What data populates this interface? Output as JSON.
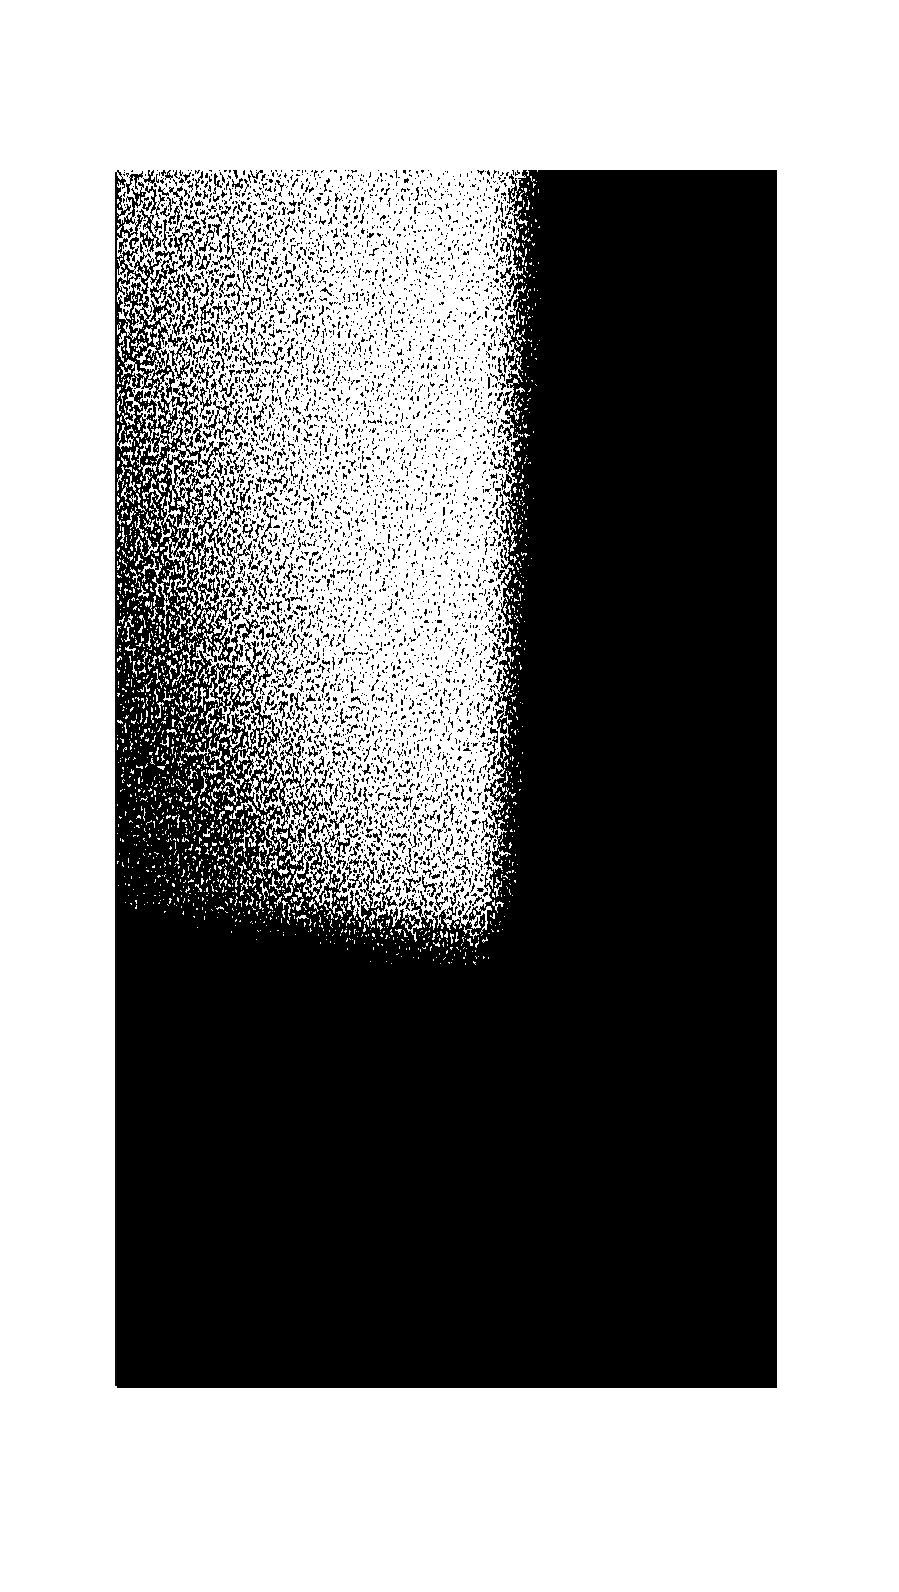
{
  "page": {
    "background": "#ffffff",
    "width": 899,
    "height": 1592
  },
  "figure": {
    "type": "halftone-photograph",
    "colors": {
      "ink": "#0a0a0a",
      "paper": "#ffffff"
    },
    "bounds": {
      "x": 117,
      "y": 170,
      "width": 660,
      "height": 1218
    },
    "caption": null
  }
}
